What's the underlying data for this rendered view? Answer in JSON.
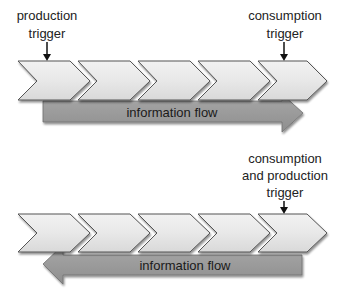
{
  "diagrams": [
    {
      "id": "top",
      "chevron_count": 5,
      "triggers": [
        {
          "lines": [
            "production",
            "trigger"
          ],
          "position": "first-chevron"
        },
        {
          "lines": [
            "consumption",
            "trigger"
          ],
          "position": "last-chevron"
        }
      ],
      "flow": {
        "label": "information flow",
        "direction": "right"
      }
    },
    {
      "id": "bottom",
      "chevron_count": 5,
      "triggers": [
        {
          "lines": [
            "consumption",
            "and production",
            "trigger"
          ],
          "position": "last-chevron"
        }
      ],
      "flow": {
        "label": "information flow",
        "direction": "left"
      }
    }
  ],
  "colors": {
    "chevron_fill": "#e6e6e6",
    "chevron_stroke": "#5a5a5a",
    "flow_fill": "#9a9a9a",
    "flow_stroke": "#6f6f6f",
    "text": "#1a1a1a"
  }
}
